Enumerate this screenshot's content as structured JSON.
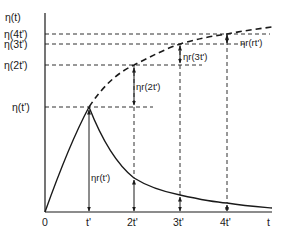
{
  "diagram": {
    "y_axis_label": "η(t)",
    "x_axis_label": "t",
    "y_labels": [
      "η(4t')",
      "η(3t')",
      "η(2t')",
      "η(t')"
    ],
    "x_ticks": [
      "0",
      "t'",
      "2t'",
      "3t'",
      "4t'"
    ],
    "annotations": {
      "eta_r_t": "ηr(t')",
      "eta_r_2t": "ηr(2t')",
      "eta_r_3t": "ηr(3t')",
      "eta_r_rt": "ηr(rt')"
    },
    "curves": [
      {
        "name": "stress-growth",
        "style": "solid",
        "description": "rise from 0 to η(t') at t'"
      },
      {
        "name": "steady-growth-continuation",
        "style": "dashed",
        "description": "extrapolated growth η(t) beyond t'"
      },
      {
        "name": "relaxation",
        "style": "solid",
        "description": "decay after cessation at t'"
      }
    ]
  }
}
